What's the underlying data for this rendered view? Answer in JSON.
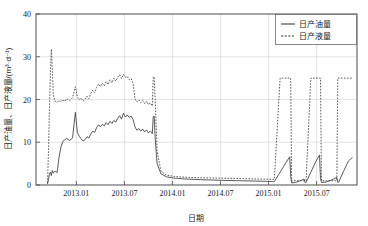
{
  "chart_data": {
    "type": "line",
    "title": "",
    "xlabel": "日期",
    "ylabel": "日产油量、日产液量/(m³·d⁻¹)",
    "xlim": [
      2012.58,
      2015.92
    ],
    "ylim": [
      0,
      40
    ],
    "yticks": [
      0,
      10,
      20,
      30,
      40
    ],
    "ytick_labels": [
      "0",
      "10",
      "20",
      "30",
      "40"
    ],
    "xticks": [
      2013.0,
      2013.5,
      2014.0,
      2014.5,
      2015.0,
      2015.5
    ],
    "xtick_labels": [
      "2013.01",
      "2013.07",
      "2014.01",
      "2014.07",
      "2015.01",
      "2015.07"
    ],
    "grid": true,
    "legend_position": "top-right",
    "series": [
      {
        "name": "日产油量",
        "style": "solid",
        "color": "#3c3c3c",
        "x": [
          2012.7,
          2012.71,
          2012.72,
          2012.73,
          2012.74,
          2012.75,
          2012.76,
          2012.78,
          2012.8,
          2012.82,
          2012.84,
          2012.86,
          2012.88,
          2012.9,
          2012.93,
          2012.96,
          2012.99,
          2013.01,
          2013.03,
          2013.05,
          2013.07,
          2013.09,
          2013.11,
          2013.13,
          2013.15,
          2013.17,
          2013.19,
          2013.21,
          2013.23,
          2013.25,
          2013.27,
          2013.29,
          2013.31,
          2013.33,
          2013.35,
          2013.37,
          2013.39,
          2013.41,
          2013.43,
          2013.45,
          2013.47,
          2013.49,
          2013.51,
          2013.53,
          2013.55,
          2013.57,
          2013.59,
          2013.61,
          2013.63,
          2013.65,
          2013.67,
          2013.69,
          2013.71,
          2013.73,
          2013.75,
          2013.77,
          2013.79,
          2013.8,
          2013.81,
          2013.82,
          2013.84,
          2013.88,
          2013.94,
          2014.02,
          2014.14,
          2014.3,
          2014.5,
          2014.7,
          2014.9,
          2015.0,
          2015.04,
          2015.05,
          2015.06,
          2015.12,
          2015.18,
          2015.22,
          2015.23,
          2015.24,
          2015.28,
          2015.33,
          2015.37,
          2015.38,
          2015.39,
          2015.44,
          2015.49,
          2015.53,
          2015.54,
          2015.55,
          2015.6,
          2015.66,
          2015.71,
          2015.72,
          2015.73,
          2015.78,
          2015.83,
          2015.87
        ],
        "y": [
          0.3,
          1.2,
          2.6,
          3.0,
          2.2,
          3.4,
          2.8,
          3.2,
          2.9,
          6.5,
          9.0,
          10.2,
          10.6,
          10.9,
          10.4,
          11.0,
          17.0,
          12.3,
          11.4,
          10.8,
          10.3,
          10.6,
          11.3,
          11.0,
          11.9,
          12.6,
          12.3,
          13.4,
          14.1,
          13.6,
          14.2,
          13.8,
          14.6,
          14.1,
          14.9,
          14.4,
          15.1,
          14.7,
          15.6,
          16.2,
          15.4,
          16.8,
          15.9,
          16.4,
          15.8,
          16.1,
          15.3,
          13.6,
          12.8,
          13.2,
          12.6,
          13.1,
          12.4,
          12.9,
          12.2,
          12.6,
          12.0,
          16.0,
          16.1,
          11.0,
          5.0,
          2.6,
          1.9,
          1.6,
          1.4,
          1.25,
          1.1,
          1.0,
          0.9,
          0.85,
          0.8,
          0.8,
          0.8,
          3.0,
          5.2,
          6.6,
          2.0,
          0.5,
          0.6,
          1.0,
          1.4,
          0.6,
          0.6,
          3.0,
          5.4,
          7.0,
          1.6,
          0.6,
          0.7,
          1.2,
          1.8,
          0.6,
          0.7,
          3.2,
          5.6,
          6.4
        ]
      },
      {
        "name": "日产液量",
        "style": "dashed",
        "color": "#3c3c3c",
        "x": [
          2012.7,
          2012.71,
          2012.72,
          2012.73,
          2012.74,
          2012.75,
          2012.76,
          2012.78,
          2012.8,
          2012.82,
          2012.84,
          2012.86,
          2012.88,
          2012.9,
          2012.93,
          2012.96,
          2012.99,
          2013.01,
          2013.03,
          2013.05,
          2013.07,
          2013.09,
          2013.11,
          2013.13,
          2013.15,
          2013.17,
          2013.19,
          2013.21,
          2013.23,
          2013.25,
          2013.27,
          2013.29,
          2013.31,
          2013.33,
          2013.35,
          2013.37,
          2013.39,
          2013.41,
          2013.43,
          2013.45,
          2013.47,
          2013.49,
          2013.51,
          2013.53,
          2013.55,
          2013.57,
          2013.59,
          2013.61,
          2013.63,
          2013.65,
          2013.67,
          2013.69,
          2013.71,
          2013.73,
          2013.75,
          2013.77,
          2013.79,
          2013.8,
          2013.81,
          2013.82,
          2013.84,
          2013.88,
          2013.94,
          2014.02,
          2014.14,
          2014.3,
          2014.5,
          2014.7,
          2014.9,
          2015.0,
          2015.04,
          2015.05,
          2015.06,
          2015.12,
          2015.18,
          2015.22,
          2015.23,
          2015.24,
          2015.28,
          2015.33,
          2015.37,
          2015.38,
          2015.39,
          2015.44,
          2015.49,
          2015.53,
          2015.54,
          2015.55,
          2015.6,
          2015.66,
          2015.71,
          2015.72,
          2015.73,
          2015.78,
          2015.83,
          2015.87
        ],
        "y": [
          0.5,
          8.0,
          18.0,
          26.0,
          31.8,
          27.0,
          21.0,
          19.6,
          19.3,
          19.8,
          19.4,
          20.0,
          19.5,
          20.2,
          19.7,
          20.4,
          23.0,
          20.6,
          19.9,
          20.3,
          19.6,
          20.1,
          20.8,
          20.2,
          21.4,
          22.2,
          21.6,
          22.8,
          23.6,
          23.0,
          23.8,
          23.2,
          24.2,
          23.5,
          24.6,
          23.9,
          25.0,
          24.3,
          25.2,
          25.8,
          24.9,
          25.9,
          25.2,
          25.4,
          24.6,
          24.9,
          23.8,
          20.2,
          19.4,
          19.9,
          19.3,
          19.8,
          19.0,
          19.6,
          18.8,
          19.2,
          18.5,
          25.2,
          25.3,
          20.0,
          8.0,
          3.2,
          2.3,
          2.0,
          1.8,
          1.7,
          1.6,
          1.5,
          1.4,
          1.35,
          1.3,
          1.3,
          1.3,
          25.0,
          25.0,
          25.0,
          25.0,
          1.0,
          1.0,
          1.0,
          1.0,
          1.0,
          1.0,
          25.0,
          25.0,
          25.0,
          25.0,
          1.0,
          1.0,
          1.0,
          1.0,
          25.0,
          25.0,
          25.0,
          25.0,
          25.0
        ]
      }
    ],
    "legend_entries": [
      {
        "label": "日产油量",
        "style": "solid"
      },
      {
        "label": "日产液量",
        "style": "dashed"
      }
    ]
  }
}
